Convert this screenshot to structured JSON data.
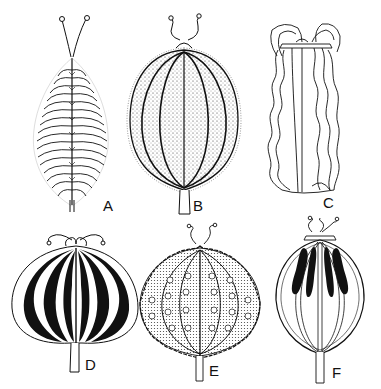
{
  "figure": {
    "ink_color": "#111111",
    "background": "#ffffff",
    "panels": [
      {
        "id": "A",
        "label": "A",
        "style": "spiny elliptic fruit with two slender styles",
        "label_pos": [
          108,
          204
        ]
      },
      {
        "id": "B",
        "label": "B",
        "style": "stippled hairy ribbed ovoid fruit on short stalk",
        "label_pos": [
          198,
          204
        ]
      },
      {
        "id": "C",
        "label": "C",
        "style": "oblong cylindrical fruit with wavy wings and hooked styles",
        "label_pos": [
          328,
          202
        ]
      },
      {
        "id": "D",
        "label": "D",
        "style": "globose fruit with bold black stripes",
        "label_pos": [
          84,
          360
        ]
      },
      {
        "id": "E",
        "label": "E",
        "style": "globose fruit with crenate wavy-margined ribs",
        "label_pos": [
          208,
          366
        ]
      },
      {
        "id": "F",
        "label": "F",
        "style": "open-ribbed globose fruit with four dark elongated seeds",
        "label_pos": [
          336,
          366
        ]
      }
    ]
  }
}
